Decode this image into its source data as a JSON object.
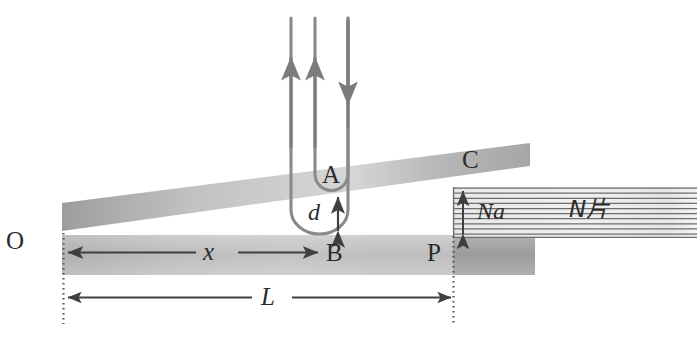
{
  "figure": {
    "background_color": "#ffffff",
    "width": 697,
    "height": 344
  },
  "colors": {
    "beam_gray_dark": "#9a9a9a",
    "beam_gray_mid": "#b4b4b4",
    "beam_gray_light": "#cfcfcf",
    "stripe_line": "#6e6e6e",
    "arrow_gray": "#7c7c7c",
    "arrow_dark": "#4a4a4a",
    "text": "#2b2b2b",
    "dotted_line": "#555555"
  },
  "labels": {
    "origin": "O",
    "point_a": "A",
    "point_b": "B",
    "point_c": "C",
    "point_p": "P",
    "gap_d": "d",
    "distance_x": "x",
    "length_L": "L",
    "stack_height": "Na",
    "plate_count": "N片"
  },
  "annotations": {
    "dimension_x": {
      "label": "x",
      "from": "O",
      "to": "B",
      "style": "double-headed-arrow"
    },
    "dimension_L": {
      "label": "L",
      "from": "O",
      "to": "P",
      "style": "double-headed-arrow"
    },
    "dimension_d": {
      "label": "d",
      "style": "double-headed-vertical-arrow"
    },
    "dimension_Na": {
      "label": "Na",
      "style": "double-headed-vertical-arrow"
    },
    "force_arrows": [
      {
        "name": "up-arrow-left",
        "direction": "up"
      },
      {
        "name": "up-arrow-right",
        "direction": "up"
      },
      {
        "name": "down-arrow",
        "direction": "down"
      }
    ]
  },
  "elements": {
    "tilted_beam": "upper inclined beam from O rising to C",
    "horizontal_beam": "lower horizontal beam from O through P",
    "plate_stack": "hatched/striped rectangular stack of N plates",
    "u_curve": "nested U-shaped deflection curves joining A and B"
  }
}
